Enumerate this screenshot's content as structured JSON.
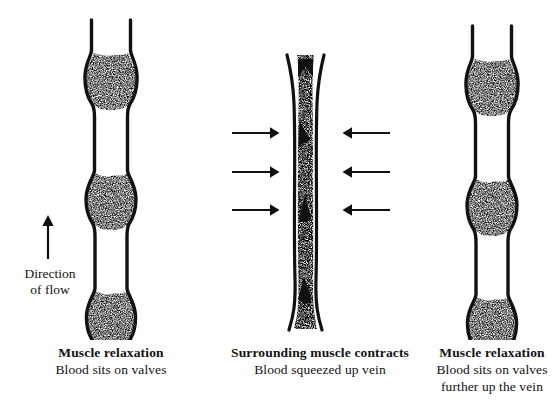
{
  "figure": {
    "background_color": "#ffffff",
    "ink_color": "#111111"
  },
  "annotations": {
    "flow_label_line1": "Direction",
    "flow_label_line2": "of flow",
    "flow_arrow_icon": "up-arrow-icon",
    "flow_arrow_direction": "up"
  },
  "panels": [
    {
      "id": "left",
      "state": "relaxed",
      "caption_title": "Muscle relaxation",
      "caption_lines": [
        "Blood sits on valves"
      ],
      "vein_description": "Wide uncompressed vein with three blood-filled valve pockets",
      "blood_chambers": 3,
      "compression_arrows": 0
    },
    {
      "id": "middle",
      "state": "contracted",
      "caption_title": "Surrounding muscle contracts",
      "caption_lines": [
        "Blood squeezed up vein"
      ],
      "vein_description": "Narrow compressed vein completely filled with blood, valves forced open",
      "blood_chambers": 1,
      "compression_arrows": 3
    },
    {
      "id": "right",
      "state": "relaxed",
      "caption_title": "Muscle relaxation",
      "caption_lines": [
        "Blood sits on valves",
        "further up the vein"
      ],
      "vein_description": "Wide uncompressed vein with blood resting on valves higher up",
      "blood_chambers": 3,
      "compression_arrows": 0
    }
  ],
  "compression_arrows": {
    "left_icon": "right-arrow-icon",
    "right_icon": "left-arrow-icon",
    "count_per_side": 3
  }
}
